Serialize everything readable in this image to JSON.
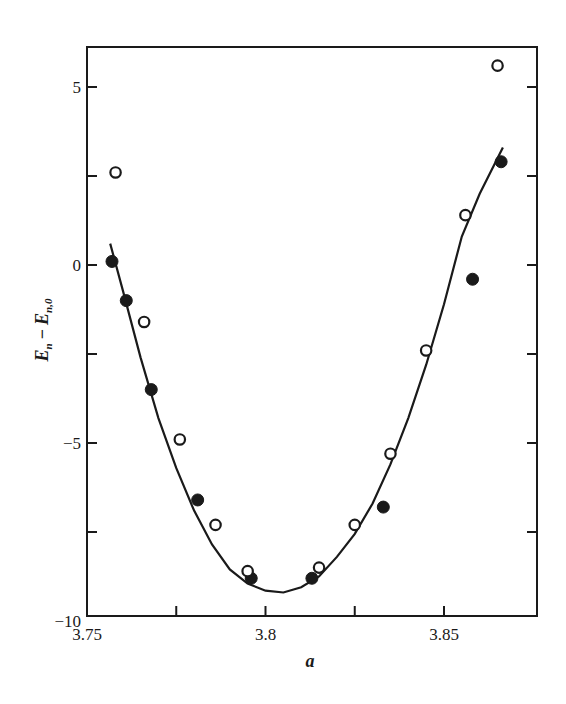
{
  "chart_data": {
    "type": "scatter",
    "title": "",
    "xlabel": "a",
    "ylabel": "E_n − E_n,0",
    "ylabel_parts": {
      "main": "E",
      "sub1": "n",
      "minus": "−",
      "main2": "E",
      "sub2": "n,0"
    },
    "xlim": [
      3.75,
      3.875
    ],
    "ylim": [
      -10,
      6
    ],
    "grid": false,
    "legend": null,
    "x_ticks": [
      {
        "value": 3.75,
        "label": "3.75"
      },
      {
        "value": 3.775,
        "label": ""
      },
      {
        "value": 3.8,
        "label": "3.8"
      },
      {
        "value": 3.825,
        "label": ""
      },
      {
        "value": 3.85,
        "label": "3.85"
      }
    ],
    "y_ticks": [
      {
        "value": 5,
        "label": "5"
      },
      {
        "value": 2.5,
        "label": ""
      },
      {
        "value": 0,
        "label": "0"
      },
      {
        "value": -2.5,
        "label": ""
      },
      {
        "value": -5,
        "label": "−5"
      },
      {
        "value": -7.5,
        "label": ""
      },
      {
        "value": -10,
        "label": "−10"
      }
    ],
    "series": [
      {
        "name": "filled circles",
        "marker": "filled-circle",
        "x": [
          3.757,
          3.761,
          3.768,
          3.781,
          3.796,
          3.813,
          3.833,
          3.858,
          3.866
        ],
        "y": [
          0.1,
          -1.0,
          -3.5,
          -6.6,
          -8.8,
          -8.8,
          -6.8,
          -0.4,
          2.9
        ]
      },
      {
        "name": "open circles",
        "marker": "open-circle",
        "x": [
          3.758,
          3.766,
          3.776,
          3.786,
          3.795,
          3.815,
          3.825,
          3.835,
          3.845,
          3.856,
          3.865
        ],
        "y": [
          2.6,
          -1.6,
          -4.9,
          -7.3,
          -8.6,
          -8.5,
          -7.3,
          -5.3,
          -2.4,
          1.4,
          5.6
        ]
      },
      {
        "name": "fitted curve",
        "marker": "line",
        "x": [
          3.7565,
          3.76,
          3.765,
          3.77,
          3.775,
          3.78,
          3.785,
          3.79,
          3.795,
          3.8,
          3.805,
          3.81,
          3.815,
          3.82,
          3.825,
          3.83,
          3.835,
          3.84,
          3.845,
          3.85,
          3.855,
          3.86,
          3.8665
        ],
        "y": [
          0.6,
          -0.7,
          -2.6,
          -4.3,
          -5.7,
          -6.9,
          -7.85,
          -8.55,
          -8.95,
          -9.15,
          -9.2,
          -9.05,
          -8.75,
          -8.2,
          -7.55,
          -6.7,
          -5.6,
          -4.3,
          -2.8,
          -1.1,
          0.8,
          2.0,
          3.3
        ]
      }
    ]
  }
}
